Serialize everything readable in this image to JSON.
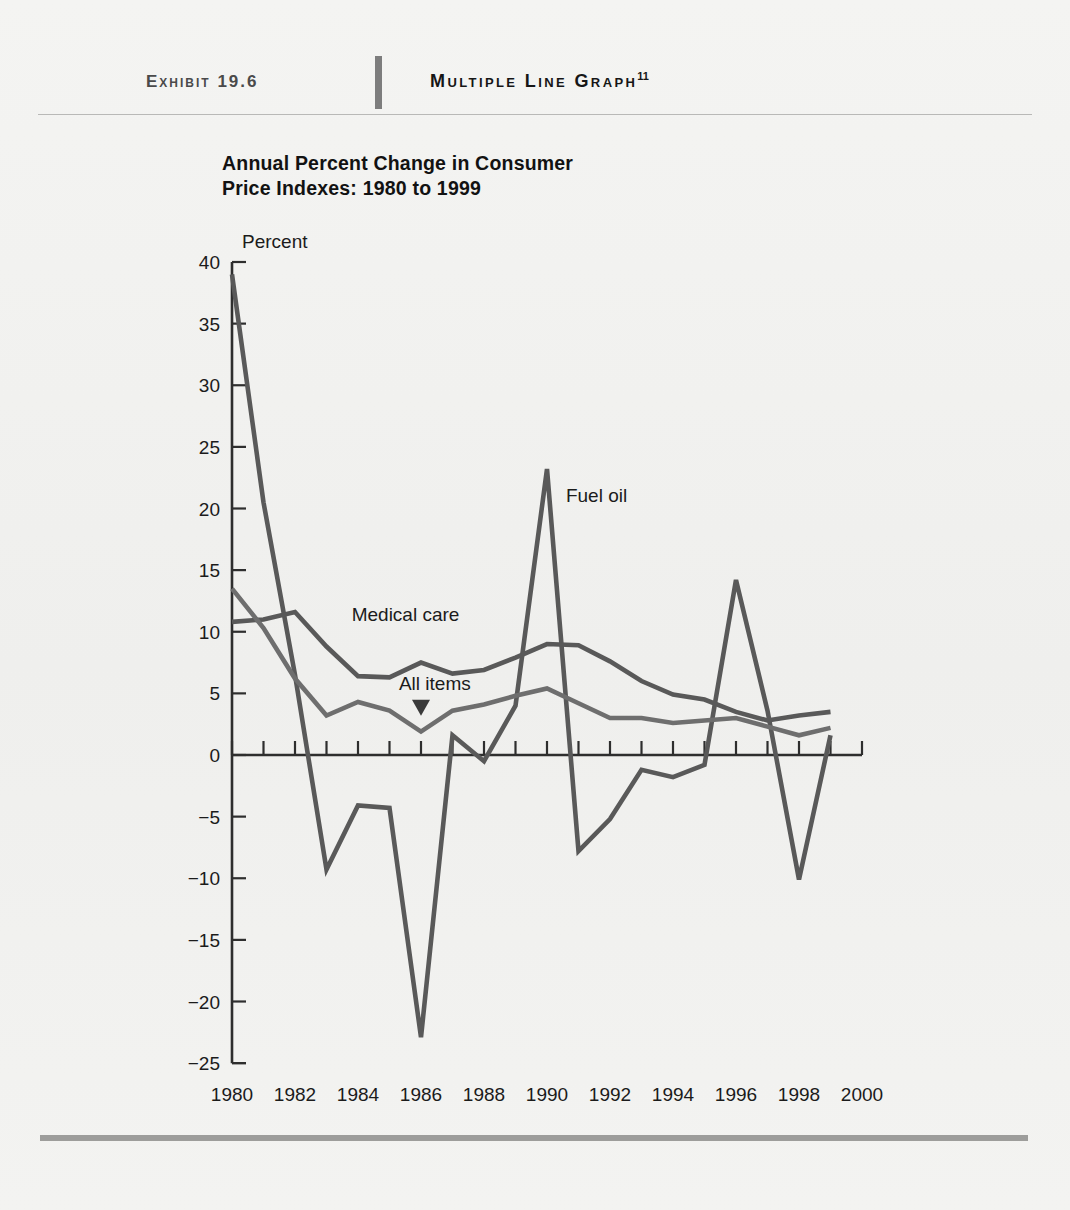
{
  "header": {
    "exhibit_label": "Exhibit 19.6",
    "exhibit_title": "Multiple Line Graph",
    "exhibit_title_superscript": "11"
  },
  "chart_title": "Annual Percent Change in Consumer\nPrice Indexes: 1980 to 1999",
  "chart_data": {
    "type": "line",
    "title": "Annual Percent Change in Consumer Price Indexes: 1980 to 1999",
    "xlabel": "",
    "ylabel": "Percent",
    "unit_label": "Percent",
    "xlim": [
      1980,
      2000
    ],
    "ylim": [
      -25,
      40
    ],
    "ytick_labels": [
      "40",
      "35",
      "30",
      "25",
      "20",
      "15",
      "10",
      "5",
      "0",
      "−5",
      "−10",
      "−15",
      "−20",
      "−25"
    ],
    "ytick_values": [
      40,
      35,
      30,
      25,
      20,
      15,
      10,
      5,
      0,
      -5,
      -10,
      -15,
      -20,
      -25
    ],
    "xtick_labels": [
      "1980",
      "1982",
      "1984",
      "1986",
      "1988",
      "1990",
      "1992",
      "1994",
      "1996",
      "1998",
      "2000"
    ],
    "xtick_values": [
      1980,
      1982,
      1984,
      1986,
      1988,
      1990,
      1992,
      1994,
      1996,
      1998,
      2000
    ],
    "minor_x_ticks_every": 1,
    "grid": false,
    "legend": "inline-labels",
    "x": [
      1980,
      1981,
      1982,
      1983,
      1984,
      1985,
      1986,
      1987,
      1988,
      1989,
      1990,
      1991,
      1992,
      1993,
      1994,
      1995,
      1996,
      1997,
      1998,
      1999
    ],
    "series": [
      {
        "name": "Fuel oil",
        "color": "#595959",
        "label_x": 1990.6,
        "label_y": 20.5,
        "values": [
          39.0,
          20.5,
          6.5,
          -9.3,
          -4.1,
          -4.3,
          -22.9,
          1.6,
          -0.5,
          4.0,
          23.2,
          -7.8,
          -5.2,
          -1.2,
          -1.8,
          -0.8,
          14.2,
          3.6,
          -10.1,
          1.6
        ]
      },
      {
        "name": "Medical care",
        "color": "#595959",
        "label_x": 1983.8,
        "label_y": 10.9,
        "values": [
          10.8,
          11.0,
          11.6,
          8.8,
          6.4,
          6.3,
          7.5,
          6.6,
          6.9,
          7.9,
          9.0,
          8.9,
          7.6,
          6.0,
          4.9,
          4.5,
          3.5,
          2.8,
          3.2,
          3.5
        ]
      },
      {
        "name": "All items",
        "color": "#6e6e6e",
        "label_x": 1985.3,
        "label_y": 5.3,
        "arrow_x": 1986.0,
        "arrow_y": 3.6,
        "values": [
          13.5,
          10.3,
          6.2,
          3.2,
          4.3,
          3.6,
          1.9,
          3.6,
          4.1,
          4.8,
          5.4,
          4.2,
          3.0,
          3.0,
          2.6,
          2.8,
          3.0,
          2.3,
          1.6,
          2.2
        ]
      }
    ]
  }
}
